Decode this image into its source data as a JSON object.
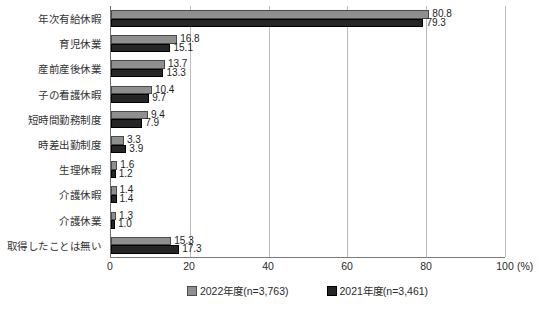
{
  "chart_data": {
    "type": "bar",
    "orientation": "horizontal",
    "title": "",
    "categories": [
      "年次有給休暇",
      "育児休業",
      "産前産後休業",
      "子の看護休暇",
      "短時間勤務制度",
      "時差出勤制度",
      "生理休暇",
      "介護休暇",
      "介護休業",
      "取得したことは無い"
    ],
    "series": [
      {
        "name": "2022年度(n=3,763)",
        "color": "#8f8f8f",
        "border_color": "#4a4a4a",
        "values": [
          80.8,
          16.8,
          13.7,
          10.4,
          9.4,
          3.3,
          1.6,
          1.4,
          1.3,
          15.3
        ]
      },
      {
        "name": "2021年度(n=3,461)",
        "color": "#262626",
        "border_color": "#000000",
        "values": [
          79.3,
          15.1,
          13.3,
          9.7,
          7.9,
          3.9,
          1.2,
          1.4,
          1.0,
          17.3
        ]
      }
    ],
    "xlabel": "",
    "ylabel": "",
    "xlim": [
      0,
      100
    ],
    "xticks": [
      0,
      20,
      40,
      60,
      80,
      100
    ],
    "x_unit": "(%)",
    "grid": "vertical",
    "gridline_color": "#bcbcbc",
    "legend_position": "bottom",
    "value_labels": true,
    "background": "#ffffff"
  }
}
